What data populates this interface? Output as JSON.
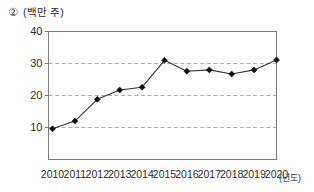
{
  "header": {
    "item_number": "②",
    "unit_label": "(백만 주)"
  },
  "chart_data": {
    "type": "line",
    "title": "",
    "subtitle": "",
    "xlabel": "(년도)",
    "ylabel": "(백만 주)",
    "categories": [
      "2010",
      "2011",
      "2012",
      "2013",
      "2014",
      "2015",
      "2016",
      "2017",
      "2018",
      "2019",
      "2020"
    ],
    "values": [
      9.6,
      12.0,
      18.8,
      21.7,
      22.6,
      31.0,
      27.6,
      28.0,
      26.7,
      28.0,
      31.1
    ],
    "series": [
      {
        "name": "주식 수",
        "values": [
          9.6,
          12.0,
          18.8,
          21.7,
          22.6,
          31.0,
          27.6,
          28.0,
          26.7,
          28.0,
          31.1
        ]
      }
    ],
    "ylim": [
      0,
      40
    ],
    "y_ticks": [
      10,
      20,
      30,
      40
    ],
    "y_tick_labels": [
      "10",
      "20",
      "30",
      "40"
    ],
    "x_tick_labels": [
      "2010",
      "2011",
      "2012",
      "2013",
      "2014",
      "2015",
      "2016",
      "2017",
      "2018",
      "2019",
      "2020"
    ],
    "grid": true,
    "grid_style": "dashed-horizontal",
    "legend": false,
    "legend_position": "none",
    "marker": "diamond",
    "line_color": "#333333",
    "marker_color": "#111111",
    "grid_color": "#999999",
    "axis_color": "#777777",
    "annotations": []
  }
}
